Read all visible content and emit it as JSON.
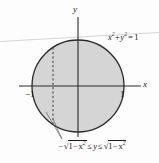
{
  "figure": {
    "type": "math-diagram",
    "axes": {
      "y_axis_label": "y",
      "x_axis_label": "x",
      "x_tick_left": "−1",
      "x_tick_right": "1"
    },
    "curve_label": {
      "full": "x² + y² = 1",
      "base1": "x",
      "exp1": "2",
      "plus": "+",
      "base2": "y",
      "exp2": "2",
      "equals": "=",
      "rhs": "1"
    },
    "region_label": {
      "full": "−√(1−x²) ≤ y ≤ √(1−x²)",
      "minus": "−",
      "radical": "√",
      "inner_one": "1",
      "inner_minus": "−",
      "inner_base": "x",
      "inner_exp": "2",
      "le1": "≤",
      "var_y": "y",
      "le2": "≤"
    },
    "colors": {
      "fill": "#d5d5d5",
      "stroke": "#2b2b2b",
      "axis": "#2b2b2b",
      "dashed": "#3a3a3a",
      "faint_line": "#c8c8c8",
      "background": "#fdfdfd"
    },
    "geometry": {
      "center_x": 78,
      "center_y": 86,
      "radius": 46,
      "dashed_line_x": 53,
      "x_axis_y": 86,
      "y_axis_x": 78
    }
  }
}
